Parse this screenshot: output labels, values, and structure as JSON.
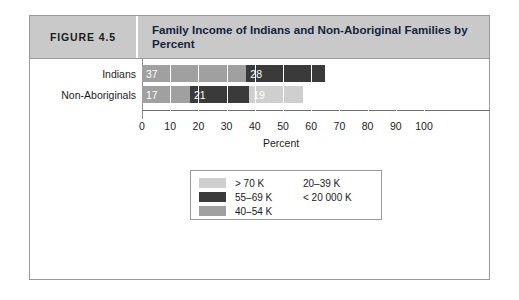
{
  "figure": {
    "number_label": "FIGURE 4.5",
    "title": "Family Income of Indians and Non-Aboriginal Families by Percent"
  },
  "colors": {
    "light_gray": "#cfcfcf",
    "medium_gray": "#a0a0a0",
    "dark_gray": "#3a3a3a",
    "header_bg": "#c9c9c9",
    "border": "#9a9a9a",
    "axis": "#6f6f6f"
  },
  "legend": {
    "left_items": [
      {
        "label": "> 70 K",
        "swatch": "light_gray"
      },
      {
        "label": "55–69 K",
        "swatch": "dark_gray"
      },
      {
        "label": "40–54 K",
        "swatch": "medium_gray"
      }
    ],
    "right_items": [
      {
        "label": "20–39 K"
      },
      {
        "label": "< 20 000 K"
      }
    ]
  },
  "chart_data": {
    "type": "bar",
    "orientation": "horizontal",
    "stacked": true,
    "title": "Family Income of Indians and Non-Aboriginal Families by Percent",
    "xlabel": "Percent",
    "ylabel": "",
    "xlim": [
      0,
      100
    ],
    "xticks": [
      0,
      10,
      20,
      30,
      40,
      50,
      60,
      70,
      80,
      90,
      100
    ],
    "xtick_labels": [
      "0",
      "10",
      "20",
      "30",
      "40",
      "50",
      "60",
      "70",
      "80",
      "90",
      "100"
    ],
    "grid": true,
    "legend_position": "bottom-center",
    "categories": [
      "Indians",
      "Non-Aboriginals"
    ],
    "series": [
      {
        "name": "40–54 K",
        "color": "medium_gray",
        "values": [
          37,
          17
        ]
      },
      {
        "name": "55–69 K",
        "color": "dark_gray",
        "values": [
          28,
          21
        ]
      },
      {
        "name": "> 70 K",
        "color": "light_gray",
        "values": [
          0,
          19
        ]
      }
    ],
    "bars": [
      {
        "category": "Indians",
        "total": 65,
        "segments": [
          {
            "value": 37,
            "label": "37",
            "color": "medium_gray"
          },
          {
            "value": 28,
            "label": "28",
            "color": "dark_gray"
          }
        ]
      },
      {
        "category": "Non-Aboriginals",
        "total": 57,
        "segments": [
          {
            "value": 17,
            "label": "17",
            "color": "medium_gray"
          },
          {
            "value": 21,
            "label": "21",
            "color": "dark_gray"
          },
          {
            "value": 19,
            "label": "19",
            "color": "light_gray"
          }
        ]
      }
    ]
  }
}
